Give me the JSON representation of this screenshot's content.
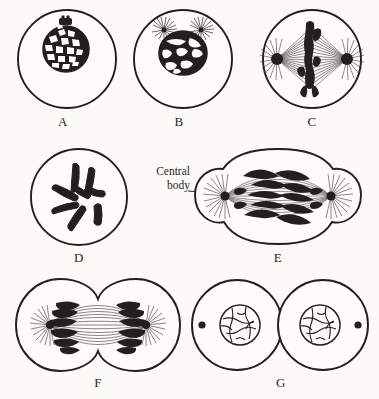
{
  "figure": {
    "background_color": "#fbfaf7",
    "ink_color": "#231f1c",
    "width": 379,
    "height": 399
  },
  "annotations": [
    {
      "id": "central-body",
      "line1": "Central",
      "line2": "body",
      "full_text": "Central body",
      "points_to": "E",
      "target": "left aster of panel E"
    }
  ],
  "panels": [
    {
      "id": "A",
      "label": "A",
      "stage": "interphase",
      "description": "Round cell with reticulated nucleus and small dark central body above nucleus",
      "cell_shape": "single circle",
      "has_nucleus": true,
      "has_spindle": false,
      "has_asters": false,
      "n_central_bodies": 1
    },
    {
      "id": "B",
      "label": "B",
      "stage": "early prophase",
      "description": "Nucleus with thick chromatin threads; two asters above the nucleus",
      "cell_shape": "single circle",
      "has_nucleus": true,
      "has_spindle": false,
      "has_asters": true,
      "n_central_bodies": 2
    },
    {
      "id": "C",
      "label": "C",
      "stage": "metaphase",
      "description": "Spindle with two polar asters and dark chromosomes aligned at the equatorial plate",
      "cell_shape": "single circle",
      "has_nucleus": false,
      "has_spindle": true,
      "has_asters": true,
      "n_central_bodies": 2
    },
    {
      "id": "D",
      "label": "D",
      "stage": "prophase chromosomes",
      "description": "Circle containing scattered V-shaped and rod-shaped black chromosomes",
      "cell_shape": "single circle",
      "has_nucleus": false,
      "has_spindle": false,
      "has_asters": false,
      "n_central_bodies": 0
    },
    {
      "id": "E",
      "label": "E",
      "stage": "anaphase",
      "description": "Slightly constricted cell; daughter chromosomes moving toward the two asters",
      "cell_shape": "lightly constricted oval",
      "has_nucleus": false,
      "has_spindle": true,
      "has_asters": true,
      "n_central_bodies": 2
    },
    {
      "id": "F",
      "label": "F",
      "stage": "telophase",
      "description": "Deep cleavage furrow; two chromosome masses near each pole with spindle fibres between",
      "cell_shape": "two lobes with deep furrow",
      "has_nucleus": false,
      "has_spindle": true,
      "has_asters": true,
      "n_central_bodies": 2
    },
    {
      "id": "G",
      "label": "G",
      "stage": "daughter cells",
      "description": "Two separated daughter cells, each with a reticulated nucleus and an outer central body",
      "cell_shape": "two touching circles",
      "has_nucleus": true,
      "has_spindle": false,
      "has_asters": false,
      "n_central_bodies": 2
    }
  ]
}
